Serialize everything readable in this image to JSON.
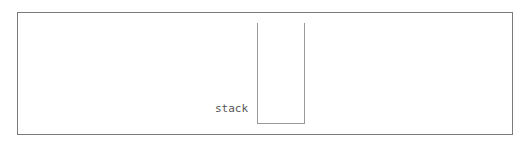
{
  "diagram": {
    "type": "stack-visualization",
    "stack": {
      "label": "stack",
      "items": []
    }
  }
}
